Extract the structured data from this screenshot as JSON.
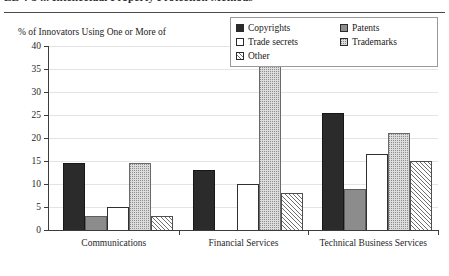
{
  "figure": {
    "title_fragment": "LE 4-5 ... Intellectual Property Protection Methods",
    "axis_caption": "% of Innovators Using One or More of"
  },
  "legend": {
    "items": [
      {
        "label": "Copyrights",
        "icon": "filled-square-black-icon",
        "color": "#2b2b2b"
      },
      {
        "label": "Patents",
        "icon": "filled-square-gray-icon",
        "color": "#8c8c8c"
      },
      {
        "label": "Trade secrets",
        "icon": "empty-square-icon",
        "color": "#ffffff"
      },
      {
        "label": "Trademarks",
        "icon": "dotted-square-icon",
        "color": "#dcdcdc"
      },
      {
        "label": "Other",
        "icon": "hatched-square-icon",
        "color": "#ffffff"
      }
    ]
  },
  "chart_data": {
    "type": "bar",
    "title": "",
    "xlabel": "",
    "ylabel": "% of Innovators Using One or More of",
    "ylim": [
      0,
      40
    ],
    "yticks": [
      0,
      5,
      10,
      15,
      20,
      25,
      30,
      35,
      40
    ],
    "ytick_labels": [
      "0",
      "5",
      "10",
      "15",
      "20",
      "25",
      "30",
      "35",
      "40"
    ],
    "grid": true,
    "legend_position": "top-right",
    "categories": [
      "Communications",
      "Financial Services",
      "Technical Business Services"
    ],
    "series": [
      {
        "name": "Copyrights",
        "values": [
          14.5,
          13.0,
          25.5
        ]
      },
      {
        "name": "Patents",
        "values": [
          3.0,
          0.0,
          9.0
        ]
      },
      {
        "name": "Trade secrets",
        "values": [
          5.0,
          10.0,
          16.5
        ]
      },
      {
        "name": "Trademarks",
        "values": [
          14.5,
          36.5,
          21.0
        ]
      },
      {
        "name": "Other",
        "values": [
          3.0,
          8.0,
          15.0
        ]
      }
    ]
  }
}
